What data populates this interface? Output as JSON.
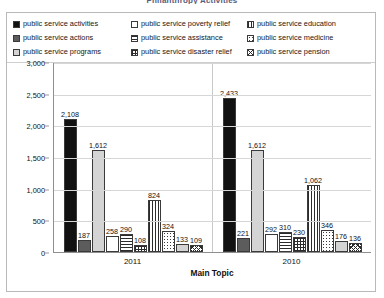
{
  "chart_data": {
    "type": "bar",
    "title": "Philanthropy Activities",
    "xlabel": "Main Topic",
    "ylabel": "",
    "ylim": [
      0,
      3000
    ],
    "ytick_labels": [
      "3,000",
      "2,500",
      "2,000",
      "1,500",
      "1,000",
      "500",
      "0"
    ],
    "ytick_values": [
      3000,
      2500,
      2000,
      1500,
      1000,
      500,
      0
    ],
    "grid": true,
    "legend_position": "top",
    "categories": [
      "2011",
      "2010"
    ],
    "series": [
      {
        "name": "public service activities",
        "pattern": "solid-black",
        "values": [
          2108,
          2433
        ],
        "labels": [
          "2,108",
          "2,433"
        ]
      },
      {
        "name": "public service actions",
        "pattern": "dark-gray",
        "values": [
          187,
          221
        ],
        "labels": [
          "187",
          "221"
        ]
      },
      {
        "name": "public service programs",
        "pattern": "light-gray",
        "values": [
          1612,
          1612
        ],
        "labels": [
          "1,612",
          "1,612"
        ]
      },
      {
        "name": "public service poverty relief",
        "pattern": "white",
        "values": [
          258,
          292
        ],
        "labels": [
          "258",
          "292"
        ]
      },
      {
        "name": "public service assistance",
        "pattern": "horiz",
        "values": [
          290,
          310
        ],
        "labels": [
          "290",
          "310"
        ]
      },
      {
        "name": "public service disaster relief",
        "pattern": "grid",
        "values": [
          108,
          230
        ],
        "labels": [
          "108",
          "230"
        ]
      },
      {
        "name": "public service education",
        "pattern": "vert",
        "values": [
          824,
          1062
        ],
        "labels": [
          "824",
          "1,062"
        ]
      },
      {
        "name": "public service medicine",
        "pattern": "dots",
        "values": [
          324,
          346
        ],
        "labels": [
          "324",
          "346"
        ]
      },
      {
        "name": "public service pension",
        "pattern": "light-gray",
        "values": [
          133,
          176
        ],
        "labels": [
          "133",
          "176"
        ]
      },
      {
        "name": "public service other",
        "pattern": "diag",
        "values": [
          109,
          136
        ],
        "labels": [
          "109",
          "136"
        ]
      }
    ]
  },
  "legend": {
    "items": [
      {
        "label": "public service activities",
        "pattern": "solid-black"
      },
      {
        "label": "public service actions",
        "pattern": "dark-gray"
      },
      {
        "label": "public service programs",
        "pattern": "light-gray"
      },
      {
        "label": "public service poverty relief",
        "pattern": "white"
      },
      {
        "label": "public service assistance",
        "pattern": "horiz"
      },
      {
        "label": "public service disaster relief",
        "pattern": "grid"
      },
      {
        "label": "public service education",
        "pattern": "vert"
      },
      {
        "label": "public service medicine",
        "pattern": "dots"
      },
      {
        "label": "public service pension",
        "pattern": "diag"
      }
    ]
  }
}
